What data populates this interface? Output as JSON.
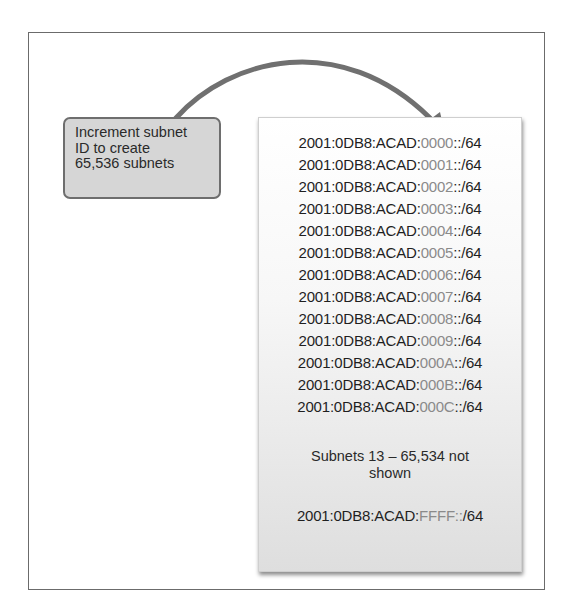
{
  "diagram": {
    "callout": {
      "lines": [
        "Increment subnet",
        "ID to create",
        "65,536 subnets"
      ]
    },
    "subnets": [
      {
        "prefix": "2001:0DB8:ACAD:",
        "id": "0000",
        "suffix": "::/64"
      },
      {
        "prefix": "2001:0DB8:ACAD:",
        "id": "0001",
        "suffix": "::/64"
      },
      {
        "prefix": "2001:0DB8:ACAD:",
        "id": "0002",
        "suffix": "::/64"
      },
      {
        "prefix": "2001:0DB8:ACAD:",
        "id": "0003",
        "suffix": "::/64"
      },
      {
        "prefix": "2001:0DB8:ACAD:",
        "id": "0004",
        "suffix": "::/64"
      },
      {
        "prefix": "2001:0DB8:ACAD:",
        "id": "0005",
        "suffix": "::/64"
      },
      {
        "prefix": "2001:0DB8:ACAD:",
        "id": "0006",
        "suffix": "::/64"
      },
      {
        "prefix": "2001:0DB8:ACAD:",
        "id": "0007",
        "suffix": "::/64"
      },
      {
        "prefix": "2001:0DB8:ACAD:",
        "id": "0008",
        "suffix": "::/64"
      },
      {
        "prefix": "2001:0DB8:ACAD:",
        "id": "0009",
        "suffix": "::/64"
      },
      {
        "prefix": "2001:0DB8:ACAD:",
        "id": "000A",
        "suffix": "::/64"
      },
      {
        "prefix": "2001:0DB8:ACAD:",
        "id": "000B",
        "suffix": "::/64"
      },
      {
        "prefix": "2001:0DB8:ACAD:",
        "id": "000C",
        "suffix": "::/64"
      }
    ],
    "note": {
      "lines": [
        "Subnets 13 – 65,534 not",
        "shown"
      ]
    },
    "last_subnet": {
      "prefix": "2001:0DB8:ACAD:",
      "id": "FFFF::",
      "suffix": "/64"
    },
    "colors": {
      "text": "#1f1f1f",
      "subnet_id": "#8a8a8a",
      "callout_fill": "#d6d6d6",
      "callout_border": "#6e6e6e",
      "arrow": "#6f6f6f",
      "frame": "#6b6b6b"
    }
  }
}
